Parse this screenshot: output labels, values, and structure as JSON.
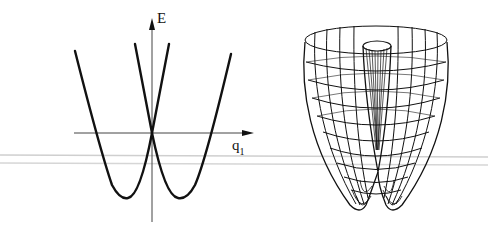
{
  "figure": {
    "left_panel": {
      "description": "Two intersecting parabolic energy curves versus coordinate q1",
      "y_axis_label": "E",
      "x_axis_label": "q",
      "x_axis_subscript": "1"
    },
    "right_panel": {
      "description": "3D wireframe surface (double-well revolved, Mexican-hat type conical intersection)"
    },
    "colors": {
      "line": "#111111",
      "axis": "#333333",
      "artifact_line": "#c8c8c8"
    }
  }
}
